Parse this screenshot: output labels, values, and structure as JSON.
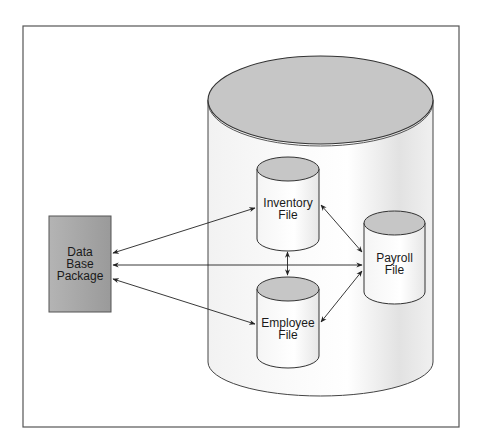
{
  "diagram": {
    "package": {
      "lines": [
        "Data",
        "Base",
        "Package"
      ]
    },
    "database": {
      "name": "data-base"
    },
    "files": {
      "inventory": {
        "lines": [
          "Inventory",
          "File"
        ]
      },
      "employee": {
        "lines": [
          "Employee",
          "File"
        ]
      },
      "payroll": {
        "lines": [
          "Payroll",
          "File"
        ]
      }
    },
    "colors": {
      "frame": "#555555",
      "package_fill": "#a8a8a8",
      "cylinder_top": "#c6c6c6",
      "cylinder_body": "#f4f4f4",
      "stroke": "#333333"
    }
  }
}
